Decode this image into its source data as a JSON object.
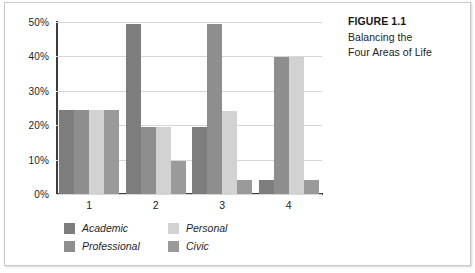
{
  "figure": {
    "caption_title": "FIGURE 1.1",
    "caption_line1": "Balancing the",
    "caption_line2": "Four Areas of Life"
  },
  "chart_data": {
    "type": "bar",
    "title": "Balancing the Four Areas of Life",
    "xlabel": "",
    "ylabel": "",
    "categories": [
      "1",
      "2",
      "3",
      "4"
    ],
    "ylim": [
      0,
      50
    ],
    "ytick_labels": [
      "0%",
      "10%",
      "20%",
      "30%",
      "40%",
      "50%"
    ],
    "ytick_values": [
      0,
      10,
      20,
      30,
      40,
      50
    ],
    "grid": true,
    "legend_position": "bottom-left",
    "series": [
      {
        "name": "Academic",
        "color": "#7d7d7d",
        "values": [
          24.5,
          49.5,
          19.5,
          4.0
        ]
      },
      {
        "name": "Professional",
        "color": "#8e8e8e",
        "values": [
          24.5,
          19.5,
          49.5,
          39.8
        ]
      },
      {
        "name": "Personal",
        "color": "#d2d2d2",
        "values": [
          24.5,
          19.5,
          24.0,
          39.8
        ]
      },
      {
        "name": "Civic",
        "color": "#9a9a9a",
        "values": [
          24.5,
          9.5,
          4.0,
          4.0
        ]
      }
    ]
  }
}
